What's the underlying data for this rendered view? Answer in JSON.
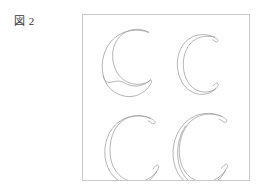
{
  "figure": {
    "caption": "図 2",
    "frame": {
      "border_color": "#c9c9c9",
      "background_color": "#ffffff",
      "x": 82,
      "y": 14,
      "width": 168,
      "height": 167
    },
    "stroke_color": "#9a9a9a",
    "shape_count": 4,
    "layout": "2x2 grid",
    "shapes": [
      {
        "id": "crescent-top-left",
        "label": "C",
        "position": "top-left",
        "description": "open crescent outline, wide aperture, thick lower limb"
      },
      {
        "id": "crescent-top-right",
        "label": "C",
        "position": "top-right",
        "description": "narrow C outline, even stroke width"
      },
      {
        "id": "crescent-bottom-left",
        "label": "C",
        "position": "bottom-left",
        "description": "rounded C outline, tapering terminals"
      },
      {
        "id": "crescent-bottom-right",
        "label": "C",
        "position": "bottom-right",
        "description": "bold crescent outline, widest aperture"
      }
    ]
  }
}
